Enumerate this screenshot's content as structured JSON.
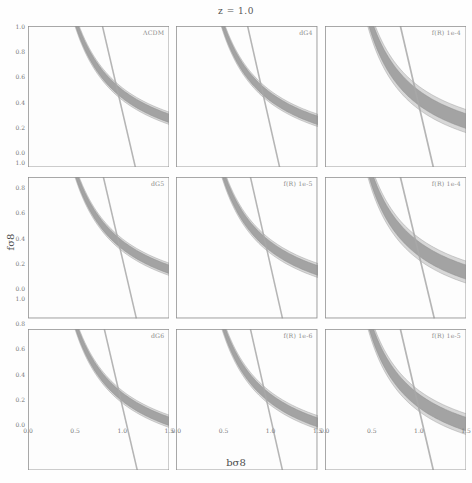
{
  "figure": {
    "suptitle": "z = 1.0",
    "xlabel": "bσ8",
    "ylabel": "fσ8"
  },
  "chart_data": {
    "type": "line",
    "title": "z = 1.0",
    "xlabel": "bσ8",
    "ylabel": "fσ8",
    "xlim": [
      0.0,
      1.5
    ],
    "ylim": [
      0.0,
      1.0
    ],
    "xticks": [
      0.0,
      0.5,
      1.0,
      1.5
    ],
    "xtick_labels": [
      "0.0",
      "0.5",
      "1.0",
      "1.5"
    ],
    "yticks": [
      0.0,
      0.2,
      0.4,
      0.6,
      0.8,
      1.0
    ],
    "ytick_labels": [
      "0.0",
      "0.2",
      "0.4",
      "0.6",
      "0.8",
      "1.0"
    ],
    "grid": false,
    "layout": {
      "rows": 3,
      "cols": 3,
      "shared_x": true,
      "shared_y": true
    },
    "colors": {
      "band_fill": "#9a9a9a",
      "band_fill_outer": "#c9c9c9",
      "band_edge": "#8a8a8a",
      "line": "#a8a8a8",
      "axis": "#8f8f8f",
      "text": "#5a5a5a",
      "panel_label": "#8c8c8c"
    },
    "panels": [
      {
        "row": 0,
        "col": 0,
        "label": "ΛCDM",
        "degenerate_band": {
          "shape": "hyperbolic",
          "amplitude": 0.52,
          "width": 0.03,
          "outer_width": 0.044,
          "crossing": [
            0.95,
            0.5
          ]
        },
        "steep_line": {
          "x_at_ytop": 0.79,
          "x_at_ybot": 1.14,
          "width": 0.016
        }
      },
      {
        "row": 0,
        "col": 1,
        "label": "dG4",
        "degenerate_band": {
          "shape": "hyperbolic",
          "amplitude": 0.5,
          "width": 0.03,
          "outer_width": 0.044,
          "crossing": [
            0.93,
            0.5
          ]
        },
        "steep_line": {
          "x_at_ytop": 0.76,
          "x_at_ybot": 1.1,
          "width": 0.016
        }
      },
      {
        "row": 0,
        "col": 2,
        "label": "f(R) 1e-4",
        "degenerate_band": {
          "shape": "hyperbolic",
          "amplitude": 0.49,
          "width": 0.052,
          "outer_width": 0.082,
          "crossing": [
            0.9,
            0.48
          ]
        },
        "steep_line": {
          "x_at_ytop": 0.8,
          "x_at_ybot": 1.15,
          "width": 0.018
        }
      },
      {
        "row": 1,
        "col": 0,
        "label": "dG5",
        "degenerate_band": {
          "shape": "hyperbolic",
          "amplitude": 0.52,
          "width": 0.03,
          "outer_width": 0.044,
          "crossing": [
            0.95,
            0.5
          ]
        },
        "steep_line": {
          "x_at_ytop": 0.8,
          "x_at_ybot": 1.15,
          "width": 0.016
        }
      },
      {
        "row": 1,
        "col": 1,
        "label": "f(R) 1e-5",
        "degenerate_band": {
          "shape": "hyperbolic",
          "amplitude": 0.51,
          "width": 0.034,
          "outer_width": 0.05,
          "crossing": [
            0.94,
            0.5
          ]
        },
        "steep_line": {
          "x_at_ytop": 0.79,
          "x_at_ybot": 1.13,
          "width": 0.016
        }
      },
      {
        "row": 1,
        "col": 2,
        "label": "f(R) 1e-4",
        "degenerate_band": {
          "shape": "hyperbolic",
          "amplitude": 0.49,
          "width": 0.05,
          "outer_width": 0.078,
          "crossing": [
            0.9,
            0.48
          ]
        },
        "steep_line": {
          "x_at_ytop": 0.8,
          "x_at_ybot": 1.16,
          "width": 0.018
        }
      },
      {
        "row": 2,
        "col": 0,
        "label": "dG6",
        "degenerate_band": {
          "shape": "hyperbolic",
          "amplitude": 0.52,
          "width": 0.03,
          "outer_width": 0.044,
          "crossing": [
            0.96,
            0.5
          ]
        },
        "steep_line": {
          "x_at_ytop": 0.81,
          "x_at_ybot": 1.16,
          "width": 0.016
        }
      },
      {
        "row": 2,
        "col": 1,
        "label": "f(R) 1e-6",
        "degenerate_band": {
          "shape": "hyperbolic",
          "amplitude": 0.51,
          "width": 0.032,
          "outer_width": 0.048,
          "crossing": [
            0.95,
            0.5
          ]
        },
        "steep_line": {
          "x_at_ytop": 0.79,
          "x_at_ybot": 1.13,
          "width": 0.016
        }
      },
      {
        "row": 2,
        "col": 2,
        "label": "f(R) 1e-5",
        "degenerate_band": {
          "shape": "hyperbolic",
          "amplitude": 0.49,
          "width": 0.048,
          "outer_width": 0.074,
          "crossing": [
            0.91,
            0.48
          ]
        },
        "steep_line": {
          "x_at_ytop": 0.8,
          "x_at_ybot": 1.15,
          "width": 0.018
        }
      }
    ]
  }
}
